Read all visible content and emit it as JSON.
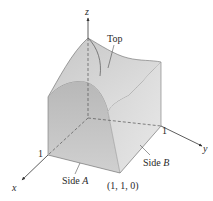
{
  "figure": {
    "axes": {
      "x": {
        "label": "x",
        "tick": "1"
      },
      "y": {
        "label": "y",
        "tick": "1"
      },
      "z": {
        "label": "z"
      }
    },
    "labels": {
      "top": "Top",
      "side_a_word": "Side ",
      "side_a_letter": "A",
      "side_b_word": "Side ",
      "side_b_letter": "B",
      "corner_point": "(1, 1, 0)"
    },
    "colors": {
      "top_surface": "#cfcfcf",
      "side_a": "#c4c4c4",
      "side_b": "#dedede",
      "base": "#e2e2e2",
      "edge": "#555555",
      "axis": "#333333"
    }
  }
}
